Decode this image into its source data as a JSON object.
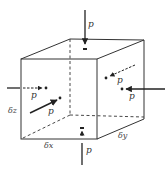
{
  "diagram": {
    "colors": {
      "edge": "#333333",
      "arrow": "#222222",
      "background": "#ffffff"
    },
    "labels": {
      "pressure_top": "p",
      "pressure_bottom": "p",
      "pressure_left": "p",
      "pressure_front": "p",
      "pressure_right": "p",
      "pressure_back": "p",
      "dim_x": "δx",
      "dim_y": "δy",
      "dim_z": "δz"
    }
  }
}
